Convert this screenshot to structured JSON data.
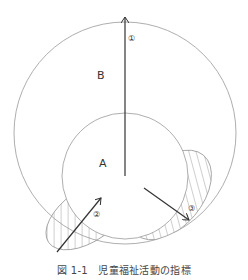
{
  "diagram": {
    "labels": {
      "outer_region": "B",
      "inner_region": "A",
      "arrow1": "①",
      "arrow2": "②",
      "arrow3": "③"
    },
    "caption": "図 1-1　児童福祉活動の指標",
    "colors": {
      "line": "#999999",
      "arrow": "#333333",
      "hatch": "#888888",
      "text": "#333333"
    }
  }
}
